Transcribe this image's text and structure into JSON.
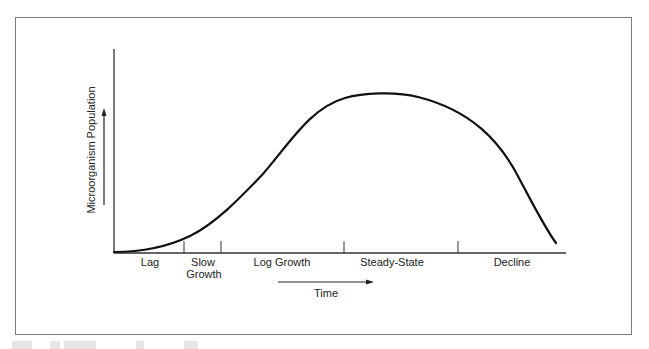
{
  "diagram": {
    "y_axis_label": "Microorganism Population",
    "x_axis_label": "Time",
    "phases": [
      {
        "label_line1": "Lag",
        "label_line2": ""
      },
      {
        "label_line1": "Slow",
        "label_line2": "Growth"
      },
      {
        "label_line1": "Log Growth",
        "label_line2": ""
      },
      {
        "label_line1": "Steady-State",
        "label_line2": ""
      },
      {
        "label_line1": "Decline",
        "label_line2": ""
      }
    ],
    "curve_color": "#111111",
    "axis_color": "#333333",
    "frame_color": "#7a7a7a"
  }
}
